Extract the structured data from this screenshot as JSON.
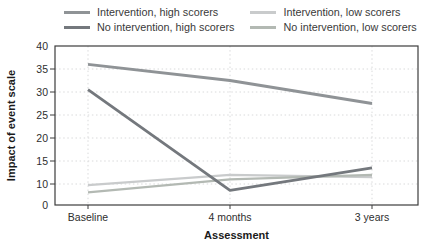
{
  "chart_data": {
    "type": "line",
    "title": "",
    "xlabel": "Assessment",
    "ylabel": "Impact of event scale",
    "categories": [
      "Baseline",
      "4 months",
      "3 years"
    ],
    "yticks": [
      40,
      35,
      30,
      25,
      20,
      15,
      10,
      0
    ],
    "ylim": [
      0,
      40
    ],
    "grid": "dotted",
    "legend_position": "top",
    "series": [
      {
        "name": "Intervention, high scorers",
        "color": "#8f9396",
        "width": 2.8,
        "values": [
          36,
          32.5,
          27.5
        ]
      },
      {
        "name": "No intervention, high scorers",
        "color": "#74787d",
        "width": 2.8,
        "values": [
          30.5,
          7,
          13.5
        ]
      },
      {
        "name": "Intervention, low scorers",
        "color": "#c9cbcc",
        "width": 2.2,
        "values": [
          9.5,
          12,
          11.5
        ]
      },
      {
        "name": "No intervention, low scorers",
        "color": "#b3b9b3",
        "width": 2.2,
        "values": [
          6,
          11,
          12
        ]
      }
    ]
  },
  "colors": {
    "background": "#ffffff",
    "plot_border": "#3c3c3c",
    "gridline": "#d9dadb",
    "text": "#2e2e2e"
  }
}
